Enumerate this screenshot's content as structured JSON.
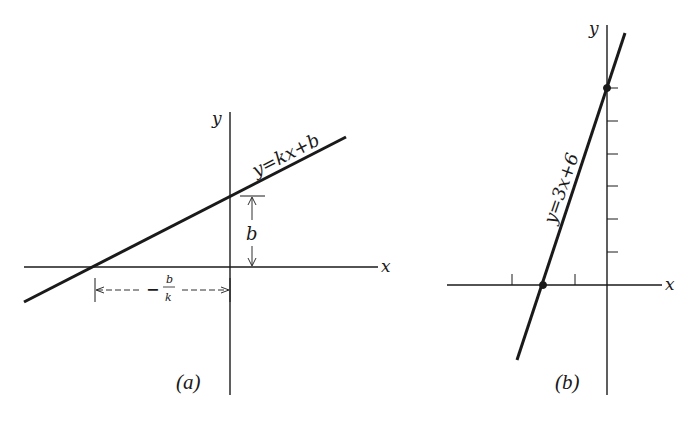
{
  "panels": [
    {
      "id": "a",
      "caption": "(a)",
      "equation_label": "y=kx+b",
      "axis_x_label": "x",
      "axis_y_label": "y",
      "intercept_label": "b",
      "x_intercept_label_sign": "−",
      "x_intercept_label_num": "b",
      "x_intercept_label_den": "k"
    },
    {
      "id": "b",
      "caption": "(b)",
      "equation_label": "y=3x+6",
      "axis_x_label": "x",
      "axis_y_label": "y",
      "y_ticks": [
        1,
        2,
        3,
        4,
        5,
        6
      ],
      "x_ticks": [
        -3,
        -2,
        -1
      ],
      "marked_points": [
        {
          "x": -2,
          "y": 0
        },
        {
          "x": 0,
          "y": 6
        }
      ]
    }
  ],
  "colors": {
    "ink": "#1a1a1a",
    "background": "#ffffff"
  }
}
